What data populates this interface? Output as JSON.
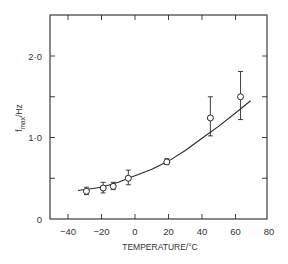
{
  "chart_data": {
    "type": "scatter",
    "title": "",
    "xlabel": "TEMPERATURE/°C",
    "ylabel": "f_max/Hz",
    "ylabel_main": "f",
    "ylabel_sub": "max",
    "ylabel_unit": "/Hz",
    "xlim": [
      -50,
      80
    ],
    "ylim": [
      0,
      2.5
    ],
    "x_ticks": [
      -40,
      -20,
      0,
      20,
      40,
      60,
      80
    ],
    "x_tick_labels": [
      "−40",
      "−20",
      "0",
      "20",
      "40",
      "60",
      "80"
    ],
    "y_ticks": [
      0,
      1.0,
      2.0
    ],
    "y_tick_labels": [
      "0",
      "1·0",
      "2·0"
    ],
    "y_minor_ticks": [
      0.5,
      1.5
    ],
    "grid": false,
    "legend": null,
    "series": [
      {
        "name": "measured",
        "marker": "open-circle",
        "points": [
          {
            "x": -29,
            "y": 0.34,
            "err_low": 0.3,
            "err_high": 0.39
          },
          {
            "x": -19,
            "y": 0.38,
            "err_low": 0.32,
            "err_high": 0.45
          },
          {
            "x": -13,
            "y": 0.4,
            "err_low": 0.36,
            "err_high": 0.45
          },
          {
            "x": -4,
            "y": 0.5,
            "err_low": 0.42,
            "err_high": 0.6
          },
          {
            "x": 19,
            "y": 0.7,
            "err_low": 0.67,
            "err_high": 0.74
          },
          {
            "x": 45,
            "y": 1.24,
            "err_low": 1.02,
            "err_high": 1.5
          },
          {
            "x": 63,
            "y": 1.5,
            "err_low": 1.22,
            "err_high": 1.81
          }
        ]
      },
      {
        "name": "fit",
        "type": "line",
        "points": [
          {
            "x": -34,
            "y": 0.35
          },
          {
            "x": -20,
            "y": 0.39
          },
          {
            "x": -10,
            "y": 0.45
          },
          {
            "x": 0,
            "y": 0.53
          },
          {
            "x": 10,
            "y": 0.61
          },
          {
            "x": 20,
            "y": 0.71
          },
          {
            "x": 30,
            "y": 0.84
          },
          {
            "x": 40,
            "y": 0.99
          },
          {
            "x": 50,
            "y": 1.14
          },
          {
            "x": 60,
            "y": 1.3
          },
          {
            "x": 69,
            "y": 1.45
          }
        ]
      }
    ]
  }
}
